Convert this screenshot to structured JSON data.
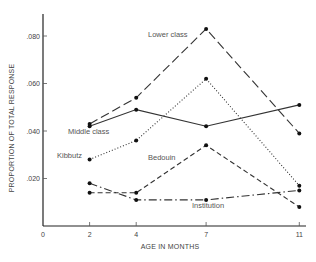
{
  "chart_data": {
    "type": "line",
    "title": "",
    "xlabel": "AGE IN MONTHS",
    "ylabel": "PROPORTION OF TOTAL RESPONSE",
    "x": [
      2,
      4,
      7,
      11
    ],
    "xlim": [
      0,
      11
    ],
    "ylim": [
      0,
      0.086
    ],
    "x_ticks": [
      {
        "value": 0,
        "label": "0"
      },
      {
        "value": 2,
        "label": "2"
      },
      {
        "value": 4,
        "label": "4"
      },
      {
        "value": 7,
        "label": "7"
      },
      {
        "value": 11,
        "label": "11"
      }
    ],
    "y_ticks": [
      {
        "value": 0.02,
        "label": ".020"
      },
      {
        "value": 0.04,
        "label": ".040"
      },
      {
        "value": 0.06,
        "label": ".060"
      },
      {
        "value": 0.08,
        "label": ".080"
      }
    ],
    "grid": false,
    "legend": "inline labels",
    "series": [
      {
        "name": "Lower class",
        "style": "long-dash",
        "values": [
          0.043,
          0.054,
          0.083,
          0.039
        ]
      },
      {
        "name": "Middle class",
        "style": "solid",
        "values": [
          0.042,
          0.049,
          0.042,
          0.051
        ]
      },
      {
        "name": "Kibbutz",
        "style": "dotted",
        "values": [
          0.028,
          0.036,
          0.062,
          0.017
        ]
      },
      {
        "name": "Bedouin",
        "style": "dashed",
        "values": [
          0.014,
          0.014,
          0.034,
          0.008
        ]
      },
      {
        "name": "Institution",
        "style": "dash-dot",
        "values": [
          0.018,
          0.011,
          0.011,
          0.015
        ]
      }
    ]
  }
}
